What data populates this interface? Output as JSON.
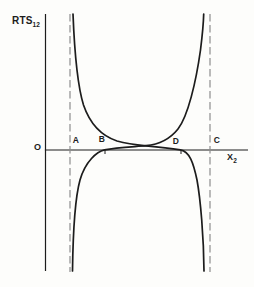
{
  "figure": {
    "type": "curve-diagram",
    "y_axis_label": {
      "text": "RTS",
      "subscript": "12"
    },
    "x_axis_label": {
      "text": "X",
      "subscript": "2"
    },
    "origin_label": "O",
    "points": [
      {
        "label": "A",
        "position": "on x-axis just right of left dashed asymptote"
      },
      {
        "label": "B",
        "position": "on x-axis where ascending curve crosses it (tick mark)"
      },
      {
        "label": "D",
        "position": "on x-axis where descending curve crosses it (tick mark)"
      },
      {
        "label": "C",
        "position": "on x-axis just right of right dashed asymptote"
      }
    ],
    "curves": [
      {
        "name": "descending-branch",
        "description": "falls from +infinity along left dashed asymptote, flattens just above x-axis, crosses the other curve mid-figure, meets axis at D, plunges to -infinity along right dashed asymptote"
      },
      {
        "name": "ascending-branch",
        "description": "rises from -infinity along left dashed asymptote, meets axis at B, rises gently past the crossing, climbs to +infinity along right dashed asymptote"
      }
    ],
    "asymptotes": [
      {
        "name": "left-dashed-asymptote"
      },
      {
        "name": "right-dashed-asymptote"
      }
    ],
    "colors": {
      "ink": "#1c1c1c",
      "dash": "#8e8e8e",
      "background": "#fdfdfb"
    }
  }
}
